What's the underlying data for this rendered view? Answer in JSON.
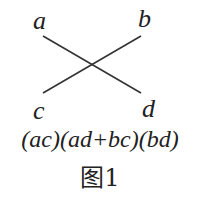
{
  "labels": {
    "a": "a",
    "b": "b",
    "c": "c",
    "d": "d"
  },
  "expression": "(ac)(ad+bc)(bd)",
  "caption": "图1",
  "line_color": "#333333"
}
